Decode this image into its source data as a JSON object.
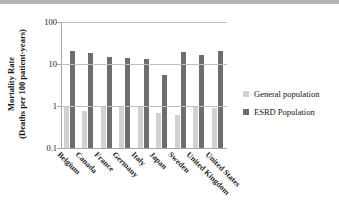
{
  "chart_data": {
    "type": "bar",
    "title": "",
    "xlabel": "",
    "ylabel": "Mortality Rate (Deaths per 100 patient-years)",
    "ylabel_lines": [
      "Mortality Rate",
      "(Deaths per 100 patient-years)"
    ],
    "yscale": "log",
    "ylim": [
      0.1,
      100
    ],
    "ytick_labels": [
      "100",
      "10",
      "1",
      "0.1"
    ],
    "ytick_values": [
      100,
      10,
      1,
      0.1
    ],
    "grid": true,
    "legend_position": "right",
    "categories": [
      "Belgium",
      "Canada",
      "France",
      "Germany",
      "Italy",
      "Japan",
      "Sweden",
      "United Kingdom",
      "United States"
    ],
    "series": [
      {
        "name": "General population",
        "color": "#d2d2d2",
        "values": [
          1.0,
          0.75,
          0.95,
          1.0,
          0.95,
          0.7,
          0.6,
          1.0,
          0.9
        ]
      },
      {
        "name": "ESRD Population",
        "color": "#6e6e6e",
        "values": [
          20,
          18,
          15,
          14,
          13,
          5.5,
          19,
          16,
          20
        ]
      }
    ]
  },
  "legend": {
    "items": [
      {
        "label": "General population",
        "color": "#d2d2d2"
      },
      {
        "label": "ESRD Population",
        "color": "#6e6e6e"
      }
    ]
  }
}
